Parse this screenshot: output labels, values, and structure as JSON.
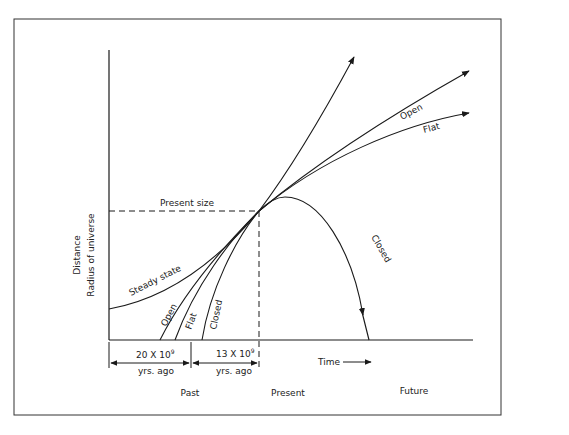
{
  "diagram": {
    "y_axis": {
      "label_line1": "Distance",
      "label_line2": "Radius of universe"
    },
    "x_axis": {
      "label": "Time",
      "arrow_icon": "right-arrow"
    },
    "present_size_label": "Present size",
    "curves": {
      "steady_state": "Steady state",
      "open_past": "Open",
      "flat_past": "Flat",
      "closed_past": "Closed",
      "open_future": "Open",
      "flat_future": "Flat",
      "closed_future": "Closed"
    },
    "intervals": [
      {
        "value": "20 X 10",
        "exponent": "9",
        "unit": "yrs. ago"
      },
      {
        "value": "13 X 10",
        "exponent": "9",
        "unit": "yrs. ago"
      }
    ],
    "time_labels": {
      "past": "Past",
      "present": "Present",
      "future": "Future"
    }
  }
}
